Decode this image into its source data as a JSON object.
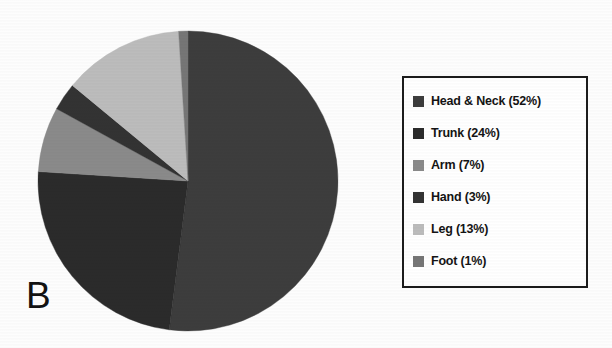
{
  "panel": {
    "label": "B"
  },
  "legend": {
    "border_color": "#1c1c1c",
    "background": "#ffffff",
    "position": "right",
    "items": [
      {
        "label": "Head & Neck (52%)",
        "swatch_name": "legend-swatch-head-neck",
        "color": "#3d3d3d"
      },
      {
        "label": "Trunk (24%)",
        "swatch_name": "legend-swatch-trunk",
        "color": "#2b2b2b"
      },
      {
        "label": "Arm (7%)",
        "swatch_name": "legend-swatch-arm",
        "color": "#8a8a8a"
      },
      {
        "label": "Hand (3%)",
        "swatch_name": "legend-swatch-hand",
        "color": "#333333"
      },
      {
        "label": "Leg (13%)",
        "swatch_name": "legend-swatch-leg",
        "color": "#bcbcbc"
      },
      {
        "label": "Foot (1%)",
        "swatch_name": "legend-swatch-foot",
        "color": "#767676"
      }
    ]
  },
  "chart_data": {
    "type": "pie",
    "title": "",
    "subtitle": "",
    "xlabel": "",
    "ylabel": "",
    "grid": false,
    "legend_position": "right",
    "panel_letter": "B",
    "start_angle_deg": 0,
    "direction": "clockwise",
    "total_percent": 100,
    "labels": [
      "Head & Neck",
      "Trunk",
      "Arm",
      "Hand",
      "Leg",
      "Foot"
    ],
    "values": [
      52,
      24,
      7,
      3,
      13,
      1
    ],
    "value_unit": "%",
    "colors": [
      "#3d3d3d",
      "#2b2b2b",
      "#8a8a8a",
      "#333333",
      "#bcbcbc",
      "#767676"
    ],
    "slices": [
      {
        "label": "Head & Neck",
        "value": 52,
        "legend_text": "Head & Neck (52%)",
        "color": "#3d3d3d"
      },
      {
        "label": "Trunk",
        "value": 24,
        "legend_text": "Trunk (24%)",
        "color": "#2b2b2b"
      },
      {
        "label": "Arm",
        "value": 7,
        "legend_text": "Arm (7%)",
        "color": "#8a8a8a"
      },
      {
        "label": "Hand",
        "value": 3,
        "legend_text": "Hand (3%)",
        "color": "#333333"
      },
      {
        "label": "Leg",
        "value": 13,
        "legend_text": "Leg (13%)",
        "color": "#bcbcbc"
      },
      {
        "label": "Foot",
        "value": 1,
        "legend_text": "Foot (1%)",
        "color": "#767676"
      }
    ],
    "geometry": {
      "center_x": 151,
      "center_y": 151,
      "radius": 150
    }
  }
}
